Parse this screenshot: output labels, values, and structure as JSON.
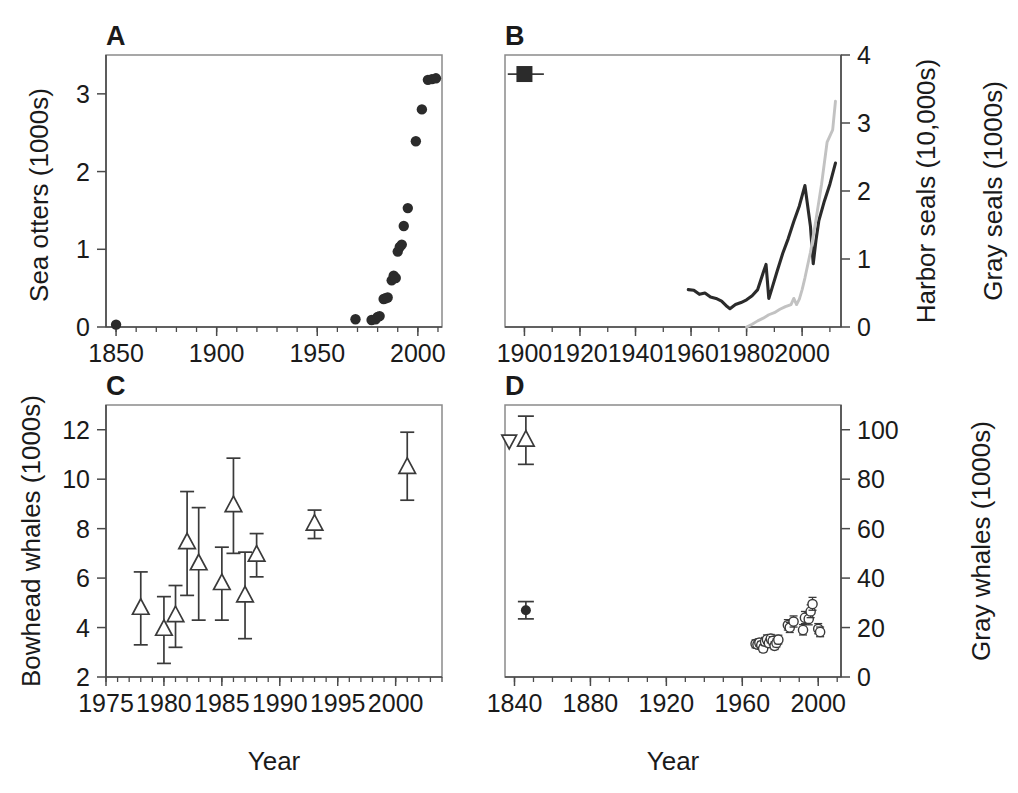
{
  "figure": {
    "xlabel_left": "Year",
    "xlabel_right": "Year"
  },
  "chart_data": [
    {
      "type": "scatter",
      "panel": "A",
      "title": "",
      "xlabel": "Year",
      "ylabel": "Sea otters (1000s)",
      "xlim": [
        1845,
        2012
      ],
      "ylim": [
        0,
        3.5
      ],
      "xticks": [
        1850,
        1900,
        1950,
        2000
      ],
      "xtick_labels": [
        "1850",
        "1900",
        "1950",
        "2000"
      ],
      "xminor_step": 10,
      "yticks": [
        0,
        1,
        2,
        3
      ],
      "ytick_labels": [
        "0",
        "1",
        "2",
        "3"
      ],
      "grid": false,
      "legend": "none",
      "marker": "filled-circle",
      "points": [
        {
          "x": 1850,
          "y": 0.03
        },
        {
          "x": 1969,
          "y": 0.1
        },
        {
          "x": 1977,
          "y": 0.09
        },
        {
          "x": 1979,
          "y": 0.1
        },
        {
          "x": 1980,
          "y": 0.13
        },
        {
          "x": 1981,
          "y": 0.14
        },
        {
          "x": 1983,
          "y": 0.36
        },
        {
          "x": 1984,
          "y": 0.37
        },
        {
          "x": 1985,
          "y": 0.38
        },
        {
          "x": 1987,
          "y": 0.6
        },
        {
          "x": 1988,
          "y": 0.66
        },
        {
          "x": 1989,
          "y": 0.63
        },
        {
          "x": 1990,
          "y": 0.97
        },
        {
          "x": 1991,
          "y": 1.03
        },
        {
          "x": 1992,
          "y": 1.06
        },
        {
          "x": 1993,
          "y": 1.3
        },
        {
          "x": 1995,
          "y": 1.53
        },
        {
          "x": 1999,
          "y": 2.39
        },
        {
          "x": 2002,
          "y": 2.8
        },
        {
          "x": 2005,
          "y": 3.18
        },
        {
          "x": 2007,
          "y": 3.19
        },
        {
          "x": 2009,
          "y": 3.2
        }
      ]
    },
    {
      "type": "line",
      "panel": "B",
      "title": "",
      "xlabel": "Year",
      "ylabel": "Harbor seals (10,000s)\nGray seals (1000s)",
      "ylabel_line1": "Harbor seals (10,000s)",
      "ylabel_line2": "Gray seals (1000s)",
      "xlim": [
        1893,
        2014
      ],
      "ylim": [
        0,
        4
      ],
      "xticks": [
        1900,
        1920,
        1940,
        1960,
        1980,
        2000
      ],
      "xtick_labels": [
        "1900",
        "1920",
        "1940",
        "1960",
        "1980",
        "2000"
      ],
      "xminor_step": 10,
      "yticks": [
        0,
        1,
        2,
        3,
        4
      ],
      "ytick_labels": [
        "0",
        "1",
        "2",
        "3",
        "4"
      ],
      "grid": false,
      "legend": "none",
      "annotations": [
        {
          "type": "point-with-xerror",
          "label": "historic-abundance-estimate",
          "x": 1900,
          "y": 3.72,
          "xerr_low": 1894,
          "xerr_high": 1907,
          "marker": "filled-square"
        }
      ],
      "series": [
        {
          "name": "Harbor seals",
          "color": "#2b2b2b",
          "x": [
            1959,
            1961,
            1963,
            1965,
            1967,
            1969,
            1971,
            1973,
            1974,
            1976,
            1978,
            1980,
            1982,
            1984,
            1986,
            1987,
            1988,
            1989,
            1991,
            1993,
            1995,
            1997,
            1999,
            2001,
            2003,
            2004,
            2005,
            2006,
            2008,
            2010,
            2012
          ],
          "y": [
            0.55,
            0.54,
            0.48,
            0.5,
            0.44,
            0.42,
            0.38,
            0.3,
            0.27,
            0.33,
            0.36,
            0.4,
            0.46,
            0.55,
            0.8,
            0.92,
            0.42,
            0.55,
            0.82,
            1.08,
            1.3,
            1.55,
            1.78,
            2.08,
            1.48,
            0.93,
            1.28,
            1.56,
            1.85,
            2.1,
            2.41
          ]
        },
        {
          "name": "Gray seals",
          "color": "#c2c2c2",
          "x": [
            1980,
            1982,
            1984,
            1986,
            1988,
            1990,
            1992,
            1994,
            1996,
            1997,
            1998,
            1999,
            2000,
            2001,
            2003,
            2005,
            2007,
            2009,
            2011,
            2012
          ],
          "y": [
            0.0,
            0.04,
            0.09,
            0.13,
            0.18,
            0.21,
            0.26,
            0.3,
            0.33,
            0.42,
            0.33,
            0.41,
            0.55,
            0.72,
            1.1,
            1.58,
            2.1,
            2.72,
            2.9,
            3.32
          ]
        }
      ]
    },
    {
      "type": "scatter",
      "panel": "C",
      "title": "",
      "xlabel": "Year",
      "ylabel": "Bowhead whales (1000s)",
      "xlim": [
        1975,
        2004
      ],
      "ylim": [
        2,
        13
      ],
      "xticks": [
        1975,
        1980,
        1985,
        1990,
        1995,
        2000
      ],
      "xtick_labels": [
        "1975",
        "1980",
        "1985",
        "1990",
        "1995",
        "2000"
      ],
      "xminor_step": 1,
      "yticks": [
        2,
        4,
        6,
        8,
        10,
        12
      ],
      "ytick_labels": [
        "2",
        "4",
        "6",
        "8",
        "10",
        "12"
      ],
      "grid": false,
      "legend": "none",
      "marker": "open-triangle-up",
      "points": [
        {
          "x": 1978,
          "y": 4.8,
          "lo": 3.3,
          "hi": 6.25
        },
        {
          "x": 1980,
          "y": 3.95,
          "lo": 2.55,
          "hi": 5.25
        },
        {
          "x": 1981,
          "y": 4.5,
          "lo": 3.2,
          "hi": 5.7
        },
        {
          "x": 1982,
          "y": 7.45,
          "lo": 5.3,
          "hi": 9.5
        },
        {
          "x": 1983,
          "y": 6.6,
          "lo": 4.3,
          "hi": 8.85
        },
        {
          "x": 1985,
          "y": 5.8,
          "lo": 4.3,
          "hi": 7.25
        },
        {
          "x": 1986,
          "y": 8.95,
          "lo": 7.0,
          "hi": 10.85
        },
        {
          "x": 1987,
          "y": 5.3,
          "lo": 3.55,
          "hi": 7.05
        },
        {
          "x": 1988,
          "y": 6.95,
          "lo": 6.05,
          "hi": 7.8
        },
        {
          "x": 1993,
          "y": 8.2,
          "lo": 7.6,
          "hi": 8.75
        },
        {
          "x": 2001,
          "y": 10.5,
          "lo": 9.15,
          "hi": 11.9
        }
      ]
    },
    {
      "type": "scatter",
      "panel": "D",
      "title": "",
      "xlabel": "Year",
      "ylabel": "Gray whales (1000s)",
      "xlim": [
        1835,
        2012
      ],
      "ylim": [
        0,
        110
      ],
      "xticks": [
        1840,
        1880,
        1920,
        1960,
        2000
      ],
      "xtick_labels": [
        "1840",
        "1880",
        "1920",
        "1960",
        "2000"
      ],
      "xminor_step": 10,
      "yticks": [
        0,
        20,
        40,
        60,
        80,
        100
      ],
      "ytick_labels": [
        "0",
        "20",
        "40",
        "60",
        "80",
        "100"
      ],
      "grid": false,
      "legend": "none",
      "historic_points": [
        {
          "x": 1843,
          "y": 95.5,
          "marker": "open-triangle-down"
        },
        {
          "x": 1846,
          "y": 96.0,
          "lo": 86.0,
          "hi": 105.5,
          "marker": "open-triangle-up"
        },
        {
          "x": 1846,
          "y": 27.0,
          "lo": 23.5,
          "hi": 30.5,
          "marker": "filled-circle"
        }
      ],
      "marker": "open-circle",
      "points": [
        {
          "x": 1967,
          "y": 13.4,
          "lo": 11.8,
          "hi": 15.0
        },
        {
          "x": 1968,
          "y": 13.1,
          "lo": 11.6,
          "hi": 14.7
        },
        {
          "x": 1969,
          "y": 13.9,
          "lo": 12.3,
          "hi": 15.5
        },
        {
          "x": 1970,
          "y": 12.9,
          "lo": 11.4,
          "hi": 14.4
        },
        {
          "x": 1971,
          "y": 11.5,
          "lo": 10.1,
          "hi": 13.0
        },
        {
          "x": 1972,
          "y": 14.3,
          "lo": 12.7,
          "hi": 16.0
        },
        {
          "x": 1973,
          "y": 15.2,
          "lo": 13.5,
          "hi": 17.0
        },
        {
          "x": 1974,
          "y": 13.7,
          "lo": 12.2,
          "hi": 15.3
        },
        {
          "x": 1975,
          "y": 15.5,
          "lo": 13.8,
          "hi": 17.2
        },
        {
          "x": 1976,
          "y": 14.6,
          "lo": 13.0,
          "hi": 16.3
        },
        {
          "x": 1977,
          "y": 12.6,
          "lo": 11.1,
          "hi": 14.2
        },
        {
          "x": 1978,
          "y": 13.8,
          "lo": 12.2,
          "hi": 15.4
        },
        {
          "x": 1979,
          "y": 15.1,
          "lo": 13.4,
          "hi": 16.9
        },
        {
          "x": 1984,
          "y": 21.0,
          "lo": 19.0,
          "hi": 23.2
        },
        {
          "x": 1985,
          "y": 20.0,
          "lo": 18.0,
          "hi": 22.1
        },
        {
          "x": 1987,
          "y": 22.4,
          "lo": 20.2,
          "hi": 24.7
        },
        {
          "x": 1992,
          "y": 19.0,
          "lo": 17.0,
          "hi": 21.2
        },
        {
          "x": 1993,
          "y": 24.0,
          "lo": 21.6,
          "hi": 26.5
        },
        {
          "x": 1995,
          "y": 23.5,
          "lo": 21.1,
          "hi": 26.0
        },
        {
          "x": 1996,
          "y": 26.5,
          "lo": 24.0,
          "hi": 29.2
        },
        {
          "x": 1997,
          "y": 29.5,
          "lo": 27.0,
          "hi": 32.2
        },
        {
          "x": 2000,
          "y": 19.5,
          "lo": 17.5,
          "hi": 21.6
        },
        {
          "x": 2001,
          "y": 18.2,
          "lo": 16.3,
          "hi": 20.2
        }
      ]
    }
  ],
  "panels": {
    "A": {
      "letter": "A",
      "ylabel": "Sea otters (1000s)"
    },
    "B": {
      "letter": "B",
      "ylabel_line1": "Harbor seals (10,000s)",
      "ylabel_line2": "Gray seals (1000s)"
    },
    "C": {
      "letter": "C",
      "ylabel": "Bowhead whales (1000s)"
    },
    "D": {
      "letter": "D",
      "ylabel": "Gray whales (1000s)"
    }
  },
  "colors": {
    "harbor_seals_line": "#2b2b2b",
    "gray_seals_line": "#c2c2c2",
    "marker_fill": "#2b2b2b",
    "axis": "#4a4a4a",
    "background": "#ffffff"
  }
}
